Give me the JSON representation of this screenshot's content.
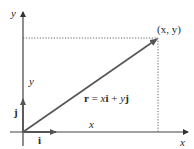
{
  "diagram": {
    "axes": {
      "x_label": "x",
      "y_label": "y"
    },
    "point_label": "(x, y)",
    "vector_label": {
      "r": "r",
      "eq": " = ",
      "x": "x",
      "i": "i",
      "plus": " + ",
      "y": "y",
      "j": "j"
    },
    "component_labels": {
      "x": "x",
      "y": "y"
    },
    "unit_vectors": {
      "i": "i",
      "j": "j"
    },
    "colors": {
      "axis": "#444444",
      "vector": "#555555",
      "dotted": "#555555",
      "text": "#2a2a2a"
    }
  }
}
